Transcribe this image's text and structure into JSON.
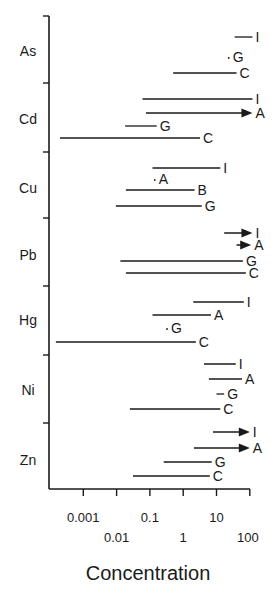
{
  "chart_data": {
    "type": "range",
    "title": "",
    "xlabel": "Concentration",
    "ylabel": "",
    "xscale": "log",
    "xlim": [
      0.0001,
      100
    ],
    "grid": false,
    "legend": null,
    "x_ticks": [
      0.001,
      0.01,
      0.1,
      1,
      10,
      100
    ],
    "x_tick_labels_row1": [
      "0.001",
      "0.1",
      "10"
    ],
    "x_tick_labels_row2": [
      "0.01",
      "1",
      "100"
    ],
    "categories": [
      "As",
      "Cd",
      "Cu",
      "Pb",
      "Hg",
      "Ni",
      "Zn"
    ],
    "groups": [
      {
        "element": "As",
        "ranges": [
          {
            "label": "I",
            "min": 35,
            "max": 120,
            "open_ended": false
          },
          {
            "label": "G",
            "min": 25,
            "max": 25,
            "open_ended": false
          },
          {
            "label": "C",
            "min": 0.5,
            "max": 40,
            "open_ended": false
          }
        ]
      },
      {
        "element": "Cd",
        "ranges": [
          {
            "label": "I",
            "min": 0.06,
            "max": 120,
            "open_ended": false
          },
          {
            "label": "A",
            "min": 0.076,
            "max": 120,
            "open_ended": true
          },
          {
            "label": "G",
            "min": 0.018,
            "max": 0.16,
            "open_ended": false
          },
          {
            "label": "C",
            "min": 0.0002,
            "max": 3.2,
            "open_ended": false
          }
        ]
      },
      {
        "element": "Cu",
        "ranges": [
          {
            "label": "I",
            "min": 0.12,
            "max": 13,
            "open_ended": false
          },
          {
            "label": "A",
            "min": 0.15,
            "max": 0.15,
            "open_ended": false
          },
          {
            "label": "B",
            "min": 0.019,
            "max": 2.2,
            "open_ended": false
          },
          {
            "label": "G",
            "min": 0.0095,
            "max": 3.6,
            "open_ended": false
          }
        ]
      },
      {
        "element": "Pb",
        "ranges": [
          {
            "label": "I",
            "min": 17,
            "max": 120,
            "open_ended": true
          },
          {
            "label": "A",
            "min": 40,
            "max": 110,
            "open_ended": true
          },
          {
            "label": "G",
            "min": 0.013,
            "max": 62,
            "open_ended": false
          },
          {
            "label": "C",
            "min": 0.019,
            "max": 76,
            "open_ended": false
          }
        ]
      },
      {
        "element": "Hg",
        "ranges": [
          {
            "label": "I",
            "min": 2,
            "max": 66,
            "open_ended": false
          },
          {
            "label": "A",
            "min": 0.12,
            "max": 6.8,
            "open_ended": false
          },
          {
            "label": "G",
            "min": 0.35,
            "max": 0.35,
            "open_ended": false
          },
          {
            "label": "C",
            "min": 0.00015,
            "max": 2.4,
            "open_ended": false
          }
        ]
      },
      {
        "element": "Ni",
        "ranges": [
          {
            "label": "I",
            "min": 4.2,
            "max": 38,
            "open_ended": false
          },
          {
            "label": "A",
            "min": 5.9,
            "max": 58,
            "open_ended": false
          },
          {
            "label": "G",
            "min": 10,
            "max": 17,
            "open_ended": false
          },
          {
            "label": "C",
            "min": 0.025,
            "max": 13,
            "open_ended": false
          }
        ]
      },
      {
        "element": "Zn",
        "ranges": [
          {
            "label": "I",
            "min": 7.8,
            "max": 100,
            "open_ended": true
          },
          {
            "label": "A",
            "min": 2.1,
            "max": 100,
            "open_ended": true
          },
          {
            "label": "G",
            "min": 0.26,
            "max": 7.2,
            "open_ended": false
          },
          {
            "label": "C",
            "min": 0.031,
            "max": 6.3,
            "open_ended": false
          }
        ]
      }
    ]
  },
  "layout_rows": {
    "As": [
      37,
      57,
      73
    ],
    "Cd": [
      99,
      113,
      126,
      138
    ],
    "Cu": [
      168,
      179,
      190,
      206
    ],
    "Pb": [
      233,
      245,
      261,
      273
    ],
    "Hg": [
      302,
      315,
      328,
      342
    ],
    "Ni": [
      364,
      379,
      394,
      409
    ],
    "Zn": [
      432,
      448,
      462,
      476
    ]
  },
  "category_label_y": [
    51,
    119,
    188,
    255,
    320,
    390,
    460
  ],
  "category_ticks_y": [
    16,
    83,
    152,
    218,
    286,
    355,
    423
  ],
  "colors": {
    "ink": "#1a1a1a",
    "background": "#ffffff"
  }
}
